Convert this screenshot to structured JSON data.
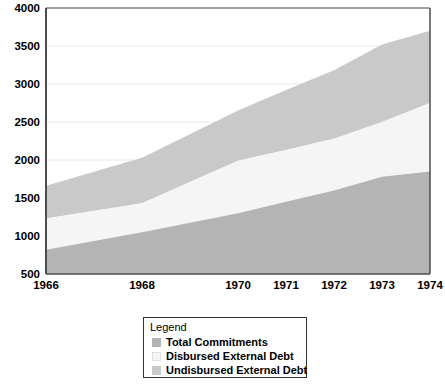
{
  "chart_data": {
    "type": "area",
    "title": "",
    "subtitle": "",
    "xlabel": "",
    "ylabel": "",
    "stacked": true,
    "grid": true,
    "x": [
      1966,
      1968,
      1970,
      1971,
      1972,
      1973,
      1974
    ],
    "xtick_labels": [
      "1966",
      "1968",
      "1970",
      "1971",
      "1972",
      "1973",
      "1974"
    ],
    "xlim": [
      1966,
      1974
    ],
    "ylim": [
      500,
      4000
    ],
    "ytick_labels": [
      "500",
      "1000",
      "1500",
      "2000",
      "2500",
      "3000",
      "3500",
      "4000"
    ],
    "yticks": [
      500,
      1000,
      1500,
      2000,
      2500,
      3000,
      3500,
      4000
    ],
    "legend_position": "below-center",
    "series": [
      {
        "name": "Total Commitments",
        "color": "#b4b4b4",
        "values": [
          820,
          1050,
          1300,
          1450,
          1600,
          1780,
          1850
        ]
      },
      {
        "name": "Disbursed External Debt",
        "color": "#f5f5f5",
        "values": [
          1230,
          1430,
          1990,
          2130,
          2280,
          2500,
          2750
        ]
      },
      {
        "name": "Undisbursed External Debt",
        "color": "#c9c9c9",
        "values": [
          1660,
          2030,
          2650,
          2920,
          3180,
          3520,
          3700
        ]
      }
    ],
    "cumulative_boundaries_note": "values are cumulative upper boundaries of each stacked band"
  },
  "legend": {
    "title": "Legend",
    "items": [
      {
        "label": "Total Commitments",
        "color": "#b4b4b4"
      },
      {
        "label": "Disbursed External Debt",
        "color": "#f5f5f5"
      },
      {
        "label": "Undisbursed External Debt",
        "color": "#c9c9c9"
      }
    ]
  },
  "colors": {
    "background": "#ffffff",
    "axis": "#4d4d4d",
    "gridline": "#e8e8e8",
    "text": "#000000",
    "legend_border": "#333333"
  }
}
